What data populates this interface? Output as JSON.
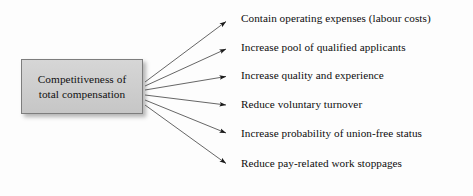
{
  "diagram": {
    "type": "fan-out-flow",
    "background_color": "#fdfdfd",
    "source": {
      "label": "Competitiveness of\ntotal compensation",
      "line1": "Competitiveness of",
      "line2": "total compensation",
      "fill_color": "#cfcfcf",
      "border_color": "#7d7d7d",
      "text_color": "#111111",
      "x": 21,
      "y": 59,
      "width": 122,
      "height": 55
    },
    "arrow_color": "#555555",
    "arrow_origin": {
      "x": 145,
      "y": 92
    },
    "outcomes": [
      {
        "label": "Contain operating expenses (labour costs)",
        "arrow_tip_y": 20,
        "label_top": 12
      },
      {
        "label": "Increase pool of qualified applicants",
        "arrow_tip_y": 48,
        "label_top": 41
      },
      {
        "label": "Increase quality and experience",
        "arrow_tip_y": 76,
        "label_top": 69
      },
      {
        "label": "Reduce voluntary turnover",
        "arrow_tip_y": 105,
        "label_top": 98
      },
      {
        "label": "Increase probability of union-free status",
        "arrow_tip_y": 134,
        "label_top": 127
      },
      {
        "label": "Reduce pay-related work stoppages",
        "arrow_tip_y": 165,
        "label_top": 157
      }
    ]
  }
}
